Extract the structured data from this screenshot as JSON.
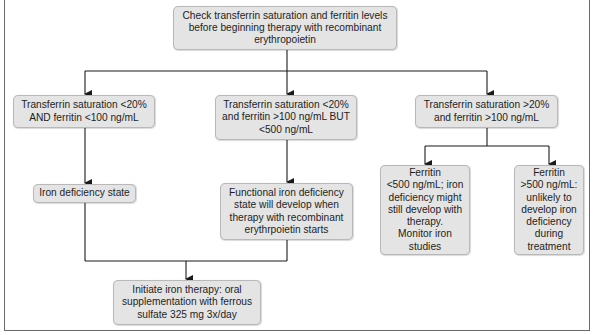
{
  "diagram": {
    "type": "flowchart",
    "start": {
      "text": "Check transferrin saturation and ferritin levels\nbefore beginning therapy with recombinant\nerythropoietin"
    },
    "branches": [
      {
        "condition": "Transferrin saturation <20%\nAND ferritin <100 ng/mL",
        "outcome": "Iron deficiency state"
      },
      {
        "condition": "Transferrin saturation <20%\nand ferritin >100 ng/mL BUT\n<500 ng/mL",
        "outcome": "Functional iron deficiency\nstate will develop when\ntherapy with recombinant\nerythrpoietin starts"
      },
      {
        "condition": "Transferrin saturation >20%\nand ferritin >100 ng/mL",
        "sub_outcomes": [
          "Ferritin\n<500 ng/mL; iron\ndeficiency might\nstill develop with\ntherapy.\nMonitor iron\nstudies",
          "Ferritin\n>500 ng/mL:\nunlikely to\ndevelop iron\ndeficiency\nduring\ntreatment"
        ]
      }
    ],
    "final": {
      "text": "Initiate iron therapy: oral\nsupplementation with ferrous\nsulfate 325 mg 3x/day"
    }
  },
  "colors": {
    "box_fill": "#e4e4e4",
    "box_border": "#b8b8b8",
    "line": "#1a1a1a",
    "frame": "#6a6a6a"
  }
}
